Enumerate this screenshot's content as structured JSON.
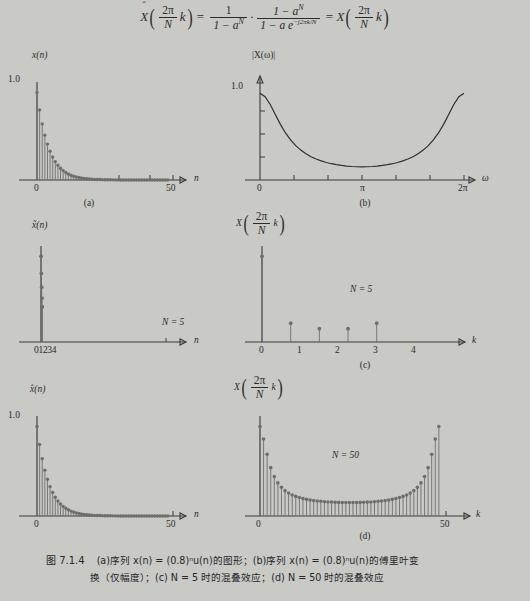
{
  "formula": {
    "lhs_fn": "X",
    "lhs_hat": "ˆ",
    "arg_num": "2π",
    "arg_den": "N",
    "arg_var": "k",
    "eq": "=",
    "f1_num": "1",
    "f1_den": "1 − a",
    "f1_den_sup": "N",
    "dot": "·",
    "f2_num": "1 − a",
    "f2_num_sup": "N",
    "f2_den": "1 − a e",
    "f2_den_sup": "−j2πk/N",
    "rhs_fn": "X"
  },
  "panels": [
    {
      "id": "a",
      "subcaption": "(a)",
      "ylabel": "x(n)",
      "ylabel_plain": "x(n)",
      "ytick": "1.0",
      "xlabel": "n",
      "xticks": [
        "0",
        "50"
      ],
      "note": ""
    },
    {
      "id": "b",
      "subcaption": "(b)",
      "ylabel": "|X(ω)|",
      "ytick": "1.0",
      "xlabel": "ω",
      "xticks": [
        "0",
        "π",
        "2π"
      ],
      "note": ""
    },
    {
      "id": "c-left",
      "subcaption": "",
      "ylabel": "x̃(n)",
      "ytick": "",
      "xlabel": "n",
      "xticks": [
        "01234"
      ],
      "note": "N = 5"
    },
    {
      "id": "c-right",
      "subcaption": "(c)",
      "ylabel_fn": "X",
      "ylabel_num": "2π",
      "ylabel_den": "N",
      "ylabel_var": "k",
      "xlabel": "k",
      "xticks": [
        "0",
        "1",
        "2",
        "3",
        "4"
      ],
      "note": "N = 5"
    },
    {
      "id": "d-left",
      "subcaption": "",
      "ylabel": "x̂(n)",
      "ytick": "1.0",
      "xlabel": "n",
      "xticks": [
        "0",
        "50"
      ],
      "note": ""
    },
    {
      "id": "d-right",
      "subcaption": "(d)",
      "ylabel_fn": "X",
      "ylabel_num": "2π",
      "ylabel_den": "N",
      "ylabel_var": "k",
      "xlabel": "k",
      "xticks": [
        "0",
        "50"
      ],
      "note": "N = 50"
    }
  ],
  "caption": {
    "fignum": "图 7.1.4",
    "line1": "(a)序列 x(n) = (0.8)ⁿu(n)的图形；(b)序列 x(n) = (0.8)ⁿu(n)的傅里叶变",
    "line2": "换（仅幅度）；(c) N = 5 时的混叠效应；(d) N = 50 时的混叠效应"
  },
  "chart_data": [
    {
      "type": "stem",
      "id": "a",
      "title": "x(n) = (0.8)^n u(n)",
      "xlabel": "n",
      "ylabel": "x(n)",
      "xlim": [
        0,
        52
      ],
      "ylim": [
        0,
        1.05
      ],
      "xticks": [
        0,
        50
      ],
      "yticks": [
        1.0
      ],
      "x": [
        0,
        1,
        2,
        3,
        4,
        5,
        6,
        7,
        8,
        9,
        10,
        11,
        12,
        13,
        14,
        15,
        16,
        17,
        18,
        19,
        20,
        21,
        22,
        23,
        24,
        25,
        26,
        27,
        28,
        29,
        30,
        31,
        32,
        33,
        34,
        35,
        36,
        37,
        38,
        39,
        40,
        41,
        42,
        43,
        44,
        45,
        46,
        47,
        48,
        49,
        50
      ],
      "values": [
        1.0,
        0.8,
        0.64,
        0.512,
        0.41,
        0.328,
        0.262,
        0.21,
        0.168,
        0.134,
        0.107,
        0.086,
        0.069,
        0.055,
        0.044,
        0.035,
        0.028,
        0.023,
        0.018,
        0.014,
        0.012,
        0.009,
        0.007,
        0.006,
        0.005,
        0.004,
        0.003,
        0.0025,
        0.002,
        0.0016,
        0.0013,
        0.001,
        0.0008,
        0.0006,
        0.0005,
        0.0004,
        0.0003,
        0.00026,
        0.0002,
        0.00017,
        0.00013,
        0.0001,
        9e-05,
        7e-05,
        5e-05,
        4e-05,
        3e-05,
        2.7e-05,
        2e-05,
        1.7e-05,
        1.4e-05
      ]
    },
    {
      "type": "line",
      "id": "b",
      "title": "|X(ω)| for x(n) = (0.8)^n u(n)",
      "xlabel": "ω",
      "ylabel": "|X(ω)|",
      "xlim": [
        0,
        6.283185
      ],
      "ylim": [
        0,
        1.05
      ],
      "xticks": [
        0,
        3.14159,
        6.283185
      ],
      "xticklabels": [
        "0",
        "π",
        "2π"
      ],
      "yticks": [
        1.0
      ],
      "formula": "1/|1-0.8 e^{-jω}| normalized so |X(0)| = 1.0",
      "x": [
        0,
        0.1571,
        0.3142,
        0.4712,
        0.6283,
        0.7854,
        0.9425,
        1.0996,
        1.2566,
        1.4137,
        1.5708,
        1.7279,
        1.885,
        2.042,
        2.1991,
        2.3562,
        2.5133,
        2.6704,
        2.8274,
        2.9845,
        3.1416,
        3.2987,
        3.4558,
        3.6128,
        3.7699,
        3.927,
        4.0841,
        4.2412,
        4.3982,
        4.5553,
        4.7124,
        4.8695,
        5.0265,
        5.1836,
        5.3407,
        5.4978,
        5.6549,
        5.8119,
        5.969,
        6.1261,
        6.2832
      ],
      "values": [
        1.0,
        0.962,
        0.871,
        0.756,
        0.642,
        0.543,
        0.462,
        0.397,
        0.345,
        0.303,
        0.269,
        0.242,
        0.22,
        0.202,
        0.188,
        0.177,
        0.168,
        0.161,
        0.156,
        0.153,
        0.152,
        0.153,
        0.156,
        0.161,
        0.168,
        0.177,
        0.188,
        0.202,
        0.22,
        0.242,
        0.269,
        0.303,
        0.345,
        0.397,
        0.462,
        0.543,
        0.642,
        0.756,
        0.871,
        0.962,
        1.0
      ]
    },
    {
      "type": "stem",
      "id": "c-left",
      "title": "periodic extension, N = 5",
      "xlabel": "n",
      "ylabel": "x̃(n)",
      "xlim": [
        0,
        52
      ],
      "ylim": [
        0,
        1.05
      ],
      "xticks": [
        0,
        1,
        2,
        3,
        4
      ],
      "x": [
        0,
        1,
        2,
        3,
        4
      ],
      "values": [
        1.0,
        0.8,
        0.64,
        0.512,
        0.41
      ]
    },
    {
      "type": "stem",
      "id": "c-right",
      "title": "DFT samples, N = 5",
      "xlabel": "k",
      "ylabel": "X(2πk/N)",
      "xlim": [
        0,
        5.3
      ],
      "ylim": [
        0,
        1.05
      ],
      "xticks": [
        0,
        1,
        2,
        3,
        4
      ],
      "x": [
        0,
        1,
        2,
        3,
        4
      ],
      "values": [
        1.0,
        0.22,
        0.155,
        0.155,
        0.22
      ]
    },
    {
      "type": "stem",
      "id": "d-left",
      "title": "periodic extension, N = 50",
      "xlabel": "n",
      "ylabel": "x̂(n)",
      "xlim": [
        0,
        52
      ],
      "ylim": [
        0,
        1.05
      ],
      "xticks": [
        0,
        50
      ],
      "yticks": [
        1.0
      ],
      "x": [
        0,
        1,
        2,
        3,
        4,
        5,
        6,
        7,
        8,
        9,
        10,
        11,
        12,
        13,
        14,
        15,
        16,
        17,
        18,
        19,
        20,
        21,
        22,
        23,
        24,
        25,
        26,
        27,
        28,
        29,
        30,
        31,
        32,
        33,
        34,
        35,
        36,
        37,
        38,
        39,
        40,
        41,
        42,
        43,
        44,
        45,
        46,
        47,
        48,
        49,
        50
      ],
      "values": [
        1.0,
        0.8,
        0.64,
        0.512,
        0.41,
        0.328,
        0.262,
        0.21,
        0.168,
        0.134,
        0.107,
        0.086,
        0.069,
        0.055,
        0.044,
        0.035,
        0.028,
        0.023,
        0.018,
        0.014,
        0.012,
        0.009,
        0.007,
        0.006,
        0.005,
        0.004,
        0.003,
        0.0025,
        0.002,
        0.0016,
        0.0013,
        0.001,
        0.0008,
        0.0006,
        0.0005,
        0.0004,
        0.0003,
        0.00026,
        0.0002,
        0.00017,
        0.00013,
        0.0001,
        9e-05,
        7e-05,
        5e-05,
        4e-05,
        3e-05,
        2.7e-05,
        2e-05,
        1.7e-05,
        1.4e-05
      ]
    },
    {
      "type": "stem",
      "id": "d-right",
      "title": "DFT samples, N = 50",
      "xlabel": "k",
      "ylabel": "X(2πk/N)",
      "xlim": [
        0,
        52
      ],
      "ylim": [
        0,
        1.05
      ],
      "xticks": [
        0,
        50
      ],
      "x": [
        0,
        1,
        2,
        3,
        4,
        5,
        6,
        7,
        8,
        9,
        10,
        11,
        12,
        13,
        14,
        15,
        16,
        17,
        18,
        19,
        20,
        21,
        22,
        23,
        24,
        25,
        26,
        27,
        28,
        29,
        30,
        31,
        32,
        33,
        34,
        35,
        36,
        37,
        38,
        39,
        40,
        41,
        42,
        43,
        44,
        45,
        46,
        47,
        48,
        49,
        50
      ],
      "values": [
        1.0,
        0.86,
        0.69,
        0.54,
        0.44,
        0.37,
        0.32,
        0.283,
        0.256,
        0.235,
        0.219,
        0.206,
        0.195,
        0.186,
        0.179,
        0.173,
        0.168,
        0.164,
        0.16,
        0.157,
        0.155,
        0.153,
        0.152,
        0.151,
        0.1505,
        0.1503,
        0.1505,
        0.151,
        0.152,
        0.153,
        0.155,
        0.157,
        0.16,
        0.164,
        0.168,
        0.173,
        0.179,
        0.186,
        0.195,
        0.206,
        0.219,
        0.235,
        0.256,
        0.283,
        0.32,
        0.37,
        0.44,
        0.54,
        0.69,
        0.86,
        1.0
      ]
    }
  ],
  "colors": {
    "background": "#c9c9c6",
    "axis": "#3a3a38",
    "stem": "#6e6e6b",
    "curve": "#2f2f2d",
    "text": "#2b2b2b"
  }
}
